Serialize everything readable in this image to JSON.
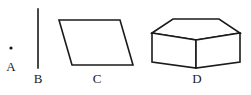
{
  "canvas": {
    "width": 251,
    "height": 95,
    "background_color": "#ffffff",
    "stroke_color": "#1a1a1a",
    "label_color": "#1a1a1a"
  },
  "figures": [
    {
      "id": "a",
      "label": "A",
      "shape_name": "point",
      "description": "a single dot representing a point",
      "label_x": 11,
      "label_y": 60,
      "point": {
        "x": 11,
        "y": 48,
        "radius": 1.6
      }
    },
    {
      "id": "b",
      "label": "B",
      "shape_name": "line-segment",
      "description": "a vertical line segment",
      "label_x": 38,
      "label_y": 72,
      "segment": {
        "x1": 38,
        "y1": 9,
        "x2": 38,
        "y2": 68,
        "stroke_width": 1.6
      }
    },
    {
      "id": "c",
      "label": "C",
      "shape_name": "parallelogram",
      "description": "a four sided parallelogram slanting to the right",
      "label_x": 97,
      "label_y": 72,
      "polygon_points": "59,20 120,20 133,65 72,65",
      "stroke_width": 1.6
    },
    {
      "id": "d",
      "label": "D",
      "shape_name": "rectangular-prism",
      "description": "a three dimensional box drawn in perspective",
      "label_x": 197,
      "label_y": 72,
      "stroke_width": 1.6,
      "front_face_points": "152,33 196,40 240,33 240,62 196,68 152,62",
      "top_face_points": "152,33 173,19 219,19 240,33 196,40",
      "edges": [
        {
          "name": "top-back-left",
          "x1": 152,
          "y1": 33,
          "x2": 173,
          "y2": 19
        },
        {
          "name": "top-back",
          "x1": 173,
          "y1": 19,
          "x2": 219,
          "y2": 19
        },
        {
          "name": "top-back-right",
          "x1": 219,
          "y1": 19,
          "x2": 240,
          "y2": 33
        },
        {
          "name": "top-front-left",
          "x1": 152,
          "y1": 33,
          "x2": 196,
          "y2": 40
        },
        {
          "name": "top-front-right",
          "x1": 196,
          "y1": 40,
          "x2": 240,
          "y2": 33
        },
        {
          "name": "vertical-left",
          "x1": 152,
          "y1": 33,
          "x2": 152,
          "y2": 62
        },
        {
          "name": "vertical-front-center",
          "x1": 196,
          "y1": 40,
          "x2": 196,
          "y2": 68
        },
        {
          "name": "vertical-right",
          "x1": 240,
          "y1": 33,
          "x2": 240,
          "y2": 62
        },
        {
          "name": "bottom-front-left",
          "x1": 152,
          "y1": 62,
          "x2": 196,
          "y2": 68
        },
        {
          "name": "bottom-front-right",
          "x1": 196,
          "y1": 68,
          "x2": 240,
          "y2": 62
        }
      ]
    }
  ]
}
